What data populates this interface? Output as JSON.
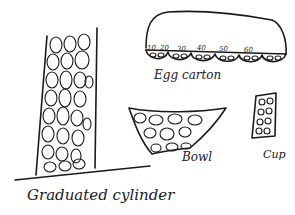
{
  "labels": {
    "cylinder": "Graduated cylinder",
    "egg_carton": "Egg carton",
    "bowl": "Bowl",
    "cup": "Cup"
  },
  "egg_carton_numbers": [
    "10",
    "20",
    "30",
    "40",
    "50",
    "60"
  ]
}
